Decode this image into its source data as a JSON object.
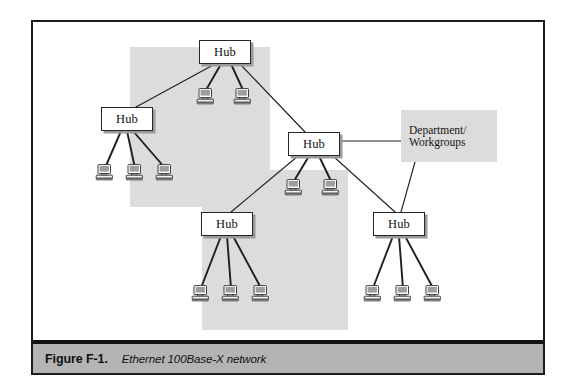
{
  "figure": {
    "caption_number": "Figure F-1.",
    "caption_text": "Ethernet 100Base-X network",
    "frame_color": "#1c1c1c",
    "caption_bar_color": "#b4b4b4",
    "shade_color": "#dcdcdc",
    "background_color": "#ffffff"
  },
  "diagram": {
    "type": "network-topology",
    "title": "Ethernet 100Base-X network",
    "node_label": "Hub",
    "annotation_label": "Department/\nWorkgroups",
    "hubs": [
      {
        "id": "hub-top",
        "label": "Hub",
        "x": 166,
        "y": 18,
        "w": 52,
        "h": 24
      },
      {
        "id": "hub-left",
        "label": "Hub",
        "x": 68,
        "y": 85,
        "w": 52,
        "h": 24
      },
      {
        "id": "hub-center",
        "label": "Hub",
        "x": 255,
        "y": 110,
        "w": 52,
        "h": 24
      },
      {
        "id": "hub-bottom-left",
        "label": "Hub",
        "x": 168,
        "y": 190,
        "w": 52,
        "h": 24
      },
      {
        "id": "hub-bottom-right",
        "label": "Hub",
        "x": 340,
        "y": 190,
        "w": 52,
        "h": 24
      }
    ],
    "annotation": {
      "id": "dept-workgroups",
      "text_line_1": "Department/",
      "text_line_2": "Workgroups",
      "x": 368,
      "y": 88,
      "w": 96,
      "h": 52
    },
    "computers": [
      {
        "id": "pc-top-1",
        "hub": "hub-top",
        "x": 163,
        "y": 66
      },
      {
        "id": "pc-top-2",
        "hub": "hub-top",
        "x": 200,
        "y": 66
      },
      {
        "id": "pc-left-1",
        "hub": "hub-left",
        "x": 62,
        "y": 142
      },
      {
        "id": "pc-left-2",
        "hub": "hub-left",
        "x": 92,
        "y": 142
      },
      {
        "id": "pc-left-3",
        "hub": "hub-left",
        "x": 122,
        "y": 142
      },
      {
        "id": "pc-ctr-1",
        "hub": "hub-center",
        "x": 251,
        "y": 157
      },
      {
        "id": "pc-ctr-2",
        "hub": "hub-center",
        "x": 288,
        "y": 157
      },
      {
        "id": "pc-bl-1",
        "hub": "hub-bottom-left",
        "x": 158,
        "y": 263
      },
      {
        "id": "pc-bl-2",
        "hub": "hub-bottom-left",
        "x": 188,
        "y": 263
      },
      {
        "id": "pc-bl-3",
        "hub": "hub-bottom-left",
        "x": 218,
        "y": 263
      },
      {
        "id": "pc-br-1",
        "hub": "hub-bottom-right",
        "x": 330,
        "y": 263
      },
      {
        "id": "pc-br-2",
        "hub": "hub-bottom-right",
        "x": 360,
        "y": 263
      },
      {
        "id": "pc-br-3",
        "hub": "hub-bottom-right",
        "x": 390,
        "y": 263
      }
    ],
    "links": [
      {
        "from": "hub-top",
        "to": "hub-left",
        "weight": "thin"
      },
      {
        "from": "hub-top",
        "to": "hub-center",
        "weight": "thin"
      },
      {
        "from": "hub-center",
        "to": "hub-bottom-left",
        "weight": "thin"
      },
      {
        "from": "hub-center",
        "to": "hub-bottom-right",
        "weight": "thin"
      },
      {
        "from": "hub-center",
        "to": "dept-workgroups",
        "weight": "thin"
      },
      {
        "from": "dept-workgroups",
        "to": "hub-bottom-right",
        "weight": "thin"
      }
    ],
    "shade_blocks": [
      {
        "id": "shade-upper",
        "x": 97,
        "y": 25,
        "w": 140,
        "h": 160
      },
      {
        "id": "shade-lower",
        "x": 169,
        "y": 148,
        "w": 146,
        "h": 160
      }
    ]
  }
}
